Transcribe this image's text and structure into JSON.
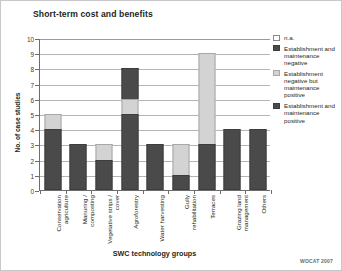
{
  "figure": {
    "title": "Short-term cost and benefits",
    "credit": "WOCAT 2007"
  },
  "legend": {
    "position": "right",
    "items": [
      {
        "label": "n.a.",
        "key": "na",
        "color": "#ffffff"
      },
      {
        "label": "Establishment and maintenance negative",
        "key": "negative",
        "color": "#4a4a4a"
      },
      {
        "label": "Establishment negative but maintenance positive",
        "key": "mixed",
        "color": "#d3d3d3"
      },
      {
        "label": "Establishment and maintenance positive",
        "key": "positive",
        "color": "#4a4a4a"
      }
    ]
  },
  "chart_data": {
    "type": "bar",
    "subtype": "stacked",
    "title": "Short-term cost and benefits",
    "xlabel": "SWC technology groups",
    "ylabel": "No. of case studies",
    "ylim": [
      0,
      10
    ],
    "yticks": [
      0,
      1,
      2,
      3,
      4,
      5,
      6,
      7,
      8,
      9,
      10
    ],
    "grid": true,
    "legend_position": "right",
    "categories": [
      "Conservation agriculture",
      "Manuring / composting",
      "Vegetative strips / cover",
      "Agroforestry",
      "Water harvesting",
      "Gully rehabilitation",
      "Terraces",
      "Grazing land management",
      "Others"
    ],
    "series": [
      {
        "name": "Establishment and maintenance positive",
        "color": "#4a4a4a",
        "values": [
          4,
          3,
          2,
          5,
          3,
          1,
          3,
          4,
          4
        ]
      },
      {
        "name": "Establishment negative but maintenance positive",
        "color": "#d3d3d3",
        "values": [
          1,
          0,
          1,
          1,
          0,
          2,
          6,
          0,
          0
        ]
      },
      {
        "name": "Establishment and maintenance negative",
        "color": "#4a4a4a",
        "values": [
          0,
          0,
          0,
          2,
          0,
          0,
          0,
          0,
          0
        ]
      },
      {
        "name": "n.a.",
        "color": "#ffffff",
        "values": [
          0,
          0,
          0,
          0,
          0,
          0,
          0,
          0,
          0
        ]
      }
    ],
    "totals": [
      5,
      3,
      3,
      8,
      3,
      3,
      9,
      4,
      4
    ]
  }
}
